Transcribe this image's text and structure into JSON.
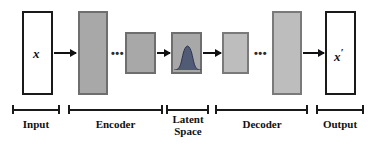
{
  "diagram": {
    "colors": {
      "background": "#ffffff",
      "box_white_fill": "#ffffff",
      "box_white_border": "#1a1a1a",
      "box_gray_fill": "#a8a8a8",
      "box_gray_border": "#6e6e6e",
      "box_gray_light_fill": "#bdbdbd",
      "arrow": "#111111",
      "gaussian": "#46506e",
      "text": "#111111"
    },
    "layers": [
      {
        "id": "input",
        "label": "",
        "style": "white",
        "x": 22,
        "y": 11,
        "w": 31,
        "h": 84
      },
      {
        "id": "encoder-1",
        "label": "",
        "style": "gray",
        "x": 78,
        "y": 11,
        "w": 30,
        "h": 84
      },
      {
        "id": "encoder-2",
        "label": "",
        "style": "gray",
        "x": 125,
        "y": 32,
        "w": 31,
        "h": 42
      },
      {
        "id": "latent",
        "label": "",
        "style": "gray",
        "x": 171,
        "y": 32,
        "w": 31,
        "h": 42
      },
      {
        "id": "decoder-1",
        "label": "",
        "style": "gray-light",
        "x": 222,
        "y": 32,
        "w": 27,
        "h": 42
      },
      {
        "id": "decoder-2",
        "label": "",
        "style": "gray-light",
        "x": 272,
        "y": 11,
        "w": 30,
        "h": 84
      },
      {
        "id": "output",
        "label": "",
        "style": "white",
        "x": 325,
        "y": 11,
        "w": 31,
        "h": 84
      }
    ],
    "variables": {
      "input_symbol": "x",
      "output_symbol": "x",
      "output_prime": "′"
    },
    "ellipses": [
      {
        "id": "encoder-ellipsis",
        "text": "•••",
        "x": 112,
        "y": 49
      },
      {
        "id": "decoder-ellipsis",
        "text": "•••",
        "x": 255,
        "y": 49
      }
    ],
    "arrows": [
      {
        "id": "arrow-input-to-encoder",
        "x": 45,
        "y": 52,
        "w": 31
      },
      {
        "id": "arrow-encoder-to-latent",
        "x": 157,
        "y": 52,
        "w": 13
      },
      {
        "id": "arrow-latent-to-decoder",
        "x": 203,
        "y": 52,
        "w": 18
      },
      {
        "id": "arrow-decoder-to-output",
        "x": 303,
        "y": 52,
        "w": 28
      }
    ],
    "latent_distribution": {
      "name": "gaussian-curve",
      "mean": 0.5,
      "sigma": 0.17,
      "fill": "#46506e"
    },
    "sections": [
      {
        "id": "input",
        "label": "Input",
        "bracket_x": 12,
        "bracket_w": 48,
        "label_x": 6,
        "label_w": 60
      },
      {
        "id": "encoder",
        "label": "Encoder",
        "bracket_x": 68,
        "bracket_w": 95,
        "label_x": 63,
        "label_w": 105
      },
      {
        "id": "latent",
        "label": "Latent\nSpace",
        "bracket_x": 166,
        "bracket_w": 43,
        "label_x": 160,
        "label_w": 56
      },
      {
        "id": "decoder",
        "label": "Decoder",
        "bracket_x": 215,
        "bracket_w": 93,
        "label_x": 212,
        "label_w": 100
      },
      {
        "id": "output",
        "label": "Output",
        "bracket_x": 316,
        "bracket_w": 48,
        "label_x": 310,
        "label_w": 60
      }
    ],
    "bracket_y": 105,
    "label_y": 119
  }
}
